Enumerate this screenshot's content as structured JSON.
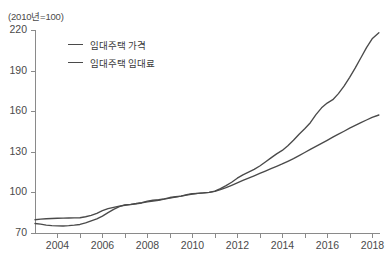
{
  "unit_note": "(2010년=100)",
  "legend": {
    "items": [
      {
        "label": "임대주택 가격",
        "color": "#4a4a4a",
        "key": "price"
      },
      {
        "label": "임대주택 임대료",
        "color": "#4a4a4a",
        "key": "rent"
      }
    ]
  },
  "chart_data": {
    "type": "line",
    "title": "",
    "subtitle": "",
    "xlabel": "",
    "ylabel": "",
    "unit_note": "(2010년=100)",
    "xlim": [
      2003.0,
      2018.35
    ],
    "ylim": [
      70,
      220
    ],
    "yticks": [
      70,
      100,
      130,
      160,
      190,
      220
    ],
    "xticks": [
      2004,
      2005,
      2006,
      2007,
      2008,
      2009,
      2010,
      2011,
      2012,
      2013,
      2014,
      2015,
      2016,
      2017,
      2018
    ],
    "xtick_labels": [
      "2004",
      "",
      "2006",
      "",
      "2008",
      "",
      "2010",
      "",
      "2012",
      "",
      "2014",
      "",
      "2016",
      "",
      "2018"
    ],
    "grid": false,
    "legend_position": "upper-left-inside",
    "series": [
      {
        "name": "임대주택 가격",
        "color": "#4a4a4a",
        "x": [
          2003.0,
          2003.25,
          2003.5,
          2003.75,
          2004.0,
          2004.25,
          2004.5,
          2004.75,
          2005.0,
          2005.25,
          2005.5,
          2005.75,
          2006.0,
          2006.25,
          2006.5,
          2006.75,
          2007.0,
          2007.25,
          2007.5,
          2007.75,
          2008.0,
          2008.25,
          2008.5,
          2008.75,
          2009.0,
          2009.25,
          2009.5,
          2009.75,
          2010.0,
          2010.25,
          2010.5,
          2010.75,
          2011.0,
          2011.25,
          2011.5,
          2011.75,
          2012.0,
          2012.25,
          2012.5,
          2012.75,
          2013.0,
          2013.25,
          2013.5,
          2013.75,
          2014.0,
          2014.25,
          2014.5,
          2014.75,
          2015.0,
          2015.25,
          2015.5,
          2015.75,
          2016.0,
          2016.25,
          2016.5,
          2016.75,
          2017.0,
          2017.25,
          2017.5,
          2017.75,
          2018.0,
          2018.3
        ],
        "y": [
          77.0,
          76.5,
          75.8,
          75.5,
          75.3,
          75.2,
          75.4,
          75.8,
          76.3,
          77.5,
          79.0,
          80.5,
          82.5,
          85.0,
          87.5,
          89.5,
          90.8,
          91.2,
          91.8,
          92.5,
          93.5,
          94.2,
          94.6,
          95.2,
          96.2,
          96.8,
          97.2,
          98.3,
          99.0,
          99.3,
          99.6,
          100.0,
          101.0,
          102.8,
          105.0,
          107.5,
          110.5,
          113.0,
          115.0,
          117.0,
          119.5,
          122.5,
          125.5,
          128.5,
          131.0,
          134.5,
          138.5,
          143.0,
          147.0,
          151.5,
          157.5,
          162.5,
          166.0,
          168.5,
          173.0,
          178.5,
          185.0,
          192.0,
          199.5,
          207.0,
          213.5,
          218.0
        ]
      },
      {
        "name": "임대주택 임대료",
        "color": "#4a4a4a",
        "x": [
          2003.0,
          2003.25,
          2003.5,
          2003.75,
          2004.0,
          2004.25,
          2004.5,
          2004.75,
          2005.0,
          2005.25,
          2005.5,
          2005.75,
          2006.0,
          2006.25,
          2006.5,
          2006.75,
          2007.0,
          2007.25,
          2007.5,
          2007.75,
          2008.0,
          2008.25,
          2008.5,
          2008.75,
          2009.0,
          2009.25,
          2009.5,
          2009.75,
          2010.0,
          2010.25,
          2010.5,
          2010.75,
          2011.0,
          2011.25,
          2011.5,
          2011.75,
          2012.0,
          2012.25,
          2012.5,
          2012.75,
          2013.0,
          2013.25,
          2013.5,
          2013.75,
          2014.0,
          2014.25,
          2014.5,
          2014.75,
          2015.0,
          2015.25,
          2015.5,
          2015.75,
          2016.0,
          2016.25,
          2016.5,
          2016.75,
          2017.0,
          2017.25,
          2017.5,
          2017.75,
          2018.0,
          2018.3
        ],
        "y": [
          79.8,
          80.2,
          80.5,
          80.7,
          80.9,
          81.0,
          81.1,
          81.2,
          81.3,
          82.0,
          83.0,
          84.5,
          86.5,
          88.0,
          89.0,
          89.8,
          90.5,
          91.0,
          91.5,
          92.2,
          93.0,
          93.6,
          94.2,
          95.0,
          95.8,
          96.5,
          97.2,
          98.0,
          98.8,
          99.3,
          99.7,
          100.0,
          100.8,
          102.0,
          103.5,
          105.2,
          107.0,
          108.8,
          110.5,
          112.2,
          114.0,
          115.8,
          117.5,
          119.2,
          121.0,
          123.0,
          125.0,
          127.2,
          129.5,
          131.8,
          134.0,
          136.2,
          138.5,
          140.8,
          143.0,
          145.2,
          147.5,
          149.5,
          151.5,
          153.5,
          155.5,
          157.2
        ]
      }
    ]
  }
}
